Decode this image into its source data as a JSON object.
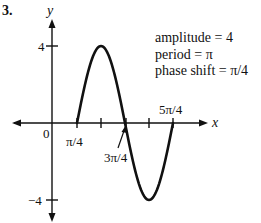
{
  "problem_number": "3.",
  "chart_data": {
    "type": "line",
    "title": "",
    "function": "y = 4 sin(2(x - π/4))",
    "xlabel": "x",
    "ylabel": "y",
    "x_ticks": [
      "π/4",
      "π/2",
      "3π/4",
      "π",
      "5π/4"
    ],
    "x_tick_labels_shown": [
      "π/4",
      "3π/4",
      "5π/4"
    ],
    "y_ticks": [
      4,
      -4
    ],
    "origin_label": "0",
    "key_points": [
      {
        "x": "π/4",
        "y": 0
      },
      {
        "x": "π/2",
        "y": 4
      },
      {
        "x": "3π/4",
        "y": 0
      },
      {
        "x": "π",
        "y": -4
      },
      {
        "x": "5π/4",
        "y": 0
      }
    ],
    "annotations": {
      "amplitude": "amplitude = 4",
      "period": "period = π",
      "phase_shift": "phase shift = π/4"
    },
    "grid": false,
    "legend": "none"
  },
  "labels": {
    "y_axis": "y",
    "x_axis": "x",
    "origin": "0",
    "y_pos": "4",
    "y_neg": "−4",
    "x_pi4": "π/4",
    "x_3pi4": "3π/4",
    "x_5pi4": "5π/4",
    "amplitude": "amplitude = 4",
    "period": "period = π",
    "phase_shift": "phase shift = π/4"
  }
}
